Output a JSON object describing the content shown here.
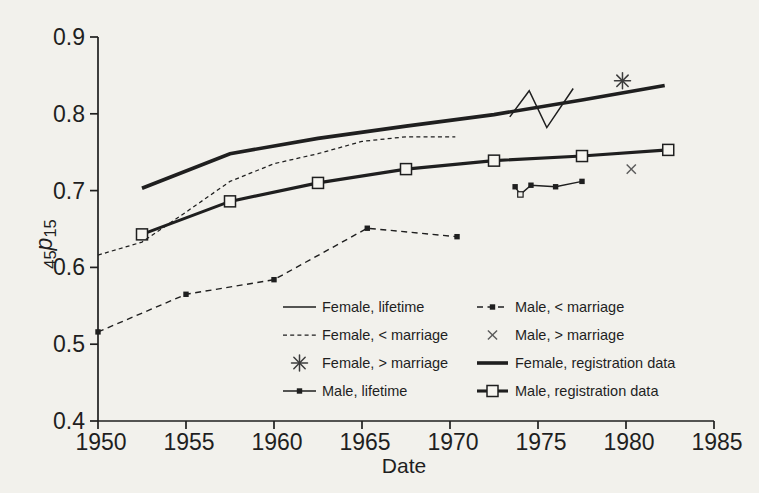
{
  "figure": {
    "background_color": "#f2f1ec",
    "ink_color": "#1f1f1f",
    "light_marker_color": "#5a5a5a"
  },
  "chart_data": {
    "type": "line",
    "title": "",
    "xlabel": "Date",
    "ylabel": "45p15",
    "ylabel_parts": {
      "pre_subscript": "45",
      "symbol": "p",
      "post_subscript": "15"
    },
    "xlim": [
      1950,
      1985
    ],
    "ylim": [
      0.4,
      0.9
    ],
    "xticks": [
      1950,
      1955,
      1960,
      1965,
      1970,
      1975,
      1980,
      1985
    ],
    "yticks": [
      0.4,
      0.5,
      0.6,
      0.7,
      0.8,
      0.9
    ],
    "grid": false,
    "legend_position": "inside bottom, two columns",
    "series": [
      {
        "name": "female_lifetime",
        "label": "Female, lifetime",
        "style": "thin-solid",
        "points": [
          [
            1973.4,
            0.796
          ],
          [
            1974.5,
            0.83
          ],
          [
            1975.5,
            0.782
          ],
          [
            1977.0,
            0.833
          ]
        ]
      },
      {
        "name": "female_before_marriage",
        "label": "Female, < marriage",
        "style": "fine-dashed",
        "points": [
          [
            1950,
            0.616
          ],
          [
            1952.5,
            0.633
          ],
          [
            1955,
            0.672
          ],
          [
            1957.5,
            0.712
          ],
          [
            1960,
            0.735
          ],
          [
            1962.5,
            0.748
          ],
          [
            1965,
            0.764
          ],
          [
            1967.5,
            0.77
          ],
          [
            1970.3,
            0.77
          ]
        ]
      },
      {
        "name": "female_after_marriage",
        "label": "Female, > marriage",
        "style": "asterisk",
        "points": [
          [
            1979.8,
            0.843
          ]
        ]
      },
      {
        "name": "male_lifetime",
        "label": "Male, lifetime",
        "style": "solid-small-squares",
        "open_markers": [
          1
        ],
        "points": [
          [
            1973.7,
            0.705
          ],
          [
            1974.0,
            0.695
          ],
          [
            1974.6,
            0.707
          ],
          [
            1976.0,
            0.705
          ],
          [
            1977.5,
            0.712
          ]
        ]
      },
      {
        "name": "male_before_marriage",
        "label": "Male, < marriage",
        "style": "dashed-small-squares",
        "points": [
          [
            1950,
            0.516
          ],
          [
            1955,
            0.565
          ],
          [
            1960,
            0.584
          ],
          [
            1965.3,
            0.651
          ],
          [
            1970.4,
            0.64
          ]
        ]
      },
      {
        "name": "male_after_marriage",
        "label": "Male, > marriage",
        "style": "x-cross",
        "points": [
          [
            1980.3,
            0.728
          ]
        ]
      },
      {
        "name": "female_registration",
        "label": "Female, registration data",
        "style": "thick-solid",
        "points": [
          [
            1952.5,
            0.703
          ],
          [
            1957.5,
            0.748
          ],
          [
            1962.5,
            0.768
          ],
          [
            1967.5,
            0.784
          ],
          [
            1972.5,
            0.799
          ],
          [
            1977.5,
            0.818
          ],
          [
            1982.2,
            0.837
          ]
        ]
      },
      {
        "name": "male_registration",
        "label": "Male, registration data",
        "style": "thick-open-squares",
        "points": [
          [
            1952.5,
            0.643
          ],
          [
            1957.5,
            0.686
          ],
          [
            1962.5,
            0.71
          ],
          [
            1967.5,
            0.728
          ],
          [
            1972.5,
            0.739
          ],
          [
            1977.5,
            0.745
          ],
          [
            1982.4,
            0.753
          ]
        ]
      }
    ],
    "legend_columns": [
      [
        "female_lifetime",
        "female_before_marriage",
        "female_after_marriage",
        "male_lifetime"
      ],
      [
        "male_before_marriage",
        "male_after_marriage",
        "female_registration",
        "male_registration"
      ]
    ]
  }
}
